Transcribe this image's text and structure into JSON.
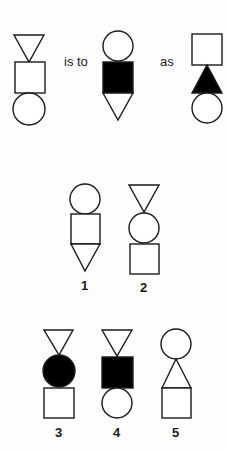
{
  "analogy": {
    "connector_1": "is to",
    "connector_2": "as",
    "figures": [
      {
        "id": "A",
        "stack": [
          "triangle-down",
          "square",
          "circle"
        ],
        "filled": []
      },
      {
        "id": "B",
        "stack": [
          "circle",
          "square",
          "triangle-down"
        ],
        "filled": [
          "square"
        ]
      },
      {
        "id": "C",
        "stack": [
          "square",
          "triangle-up",
          "circle"
        ],
        "filled": [
          "triangle-up"
        ]
      }
    ]
  },
  "options": [
    {
      "label": "1",
      "stack": [
        "circle",
        "square",
        "triangle-down"
      ],
      "filled": []
    },
    {
      "label": "2",
      "stack": [
        "triangle-down",
        "circle",
        "square"
      ],
      "filled": []
    },
    {
      "label": "3",
      "stack": [
        "triangle-down",
        "circle",
        "square"
      ],
      "filled": [
        "circle"
      ]
    },
    {
      "label": "4",
      "stack": [
        "triangle-down",
        "square",
        "circle"
      ],
      "filled": [
        "square"
      ]
    },
    {
      "label": "5",
      "stack": [
        "circle",
        "triangle-up",
        "square"
      ],
      "filled": []
    }
  ],
  "colors": {
    "ink": "#1a1a1a",
    "paper": "#fdfdfd",
    "fill": "#000000"
  }
}
